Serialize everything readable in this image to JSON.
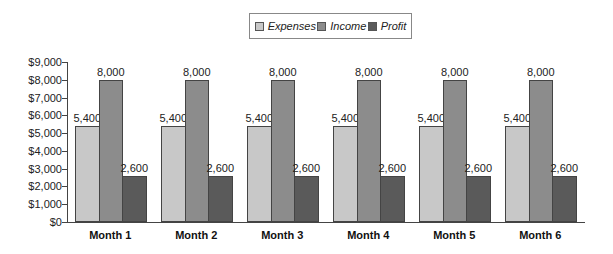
{
  "chart_data": {
    "type": "bar",
    "title": "",
    "xlabel": "",
    "ylabel": "",
    "categories": [
      "Month 1",
      "Month 2",
      "Month 3",
      "Month 4",
      "Month 5",
      "Month 6"
    ],
    "series": [
      {
        "name": "Expenses",
        "color": "#c8c8c8",
        "values": [
          5400,
          5400,
          5400,
          5400,
          5400,
          5400
        ],
        "labels": [
          "5,400",
          "5,400",
          "5,400",
          "5,400",
          "5,400",
          "5,400"
        ]
      },
      {
        "name": "Income",
        "color": "#8c8c8c",
        "values": [
          8000,
          8000,
          8000,
          8000,
          8000,
          8000
        ],
        "labels": [
          "8,000",
          "8,000",
          "8,000",
          "8,000",
          "8,000",
          "8,000"
        ]
      },
      {
        "name": "Profit",
        "color": "#5a5a5a",
        "values": [
          2600,
          2600,
          2600,
          2600,
          2600,
          2600
        ],
        "labels": [
          "2,600",
          "2,600",
          "2,600",
          "2,600",
          "2,600",
          "2,600"
        ]
      }
    ],
    "ylim": [
      0,
      9000
    ],
    "yticks": [
      0,
      1000,
      2000,
      3000,
      4000,
      5000,
      6000,
      7000,
      8000,
      9000
    ],
    "ytick_labels": [
      "$0",
      "$1,000",
      "$2,000",
      "$3,000",
      "$4,000",
      "$5,000",
      "$6,000",
      "$7,000",
      "$8,000",
      "$9,000"
    ],
    "grid": false,
    "legend_position": "top-center"
  },
  "legend": {
    "items": [
      {
        "label": "Expenses",
        "color": "#c8c8c8"
      },
      {
        "label": "Income",
        "color": "#8c8c8c"
      },
      {
        "label": "Profit",
        "color": "#5a5a5a"
      }
    ]
  }
}
